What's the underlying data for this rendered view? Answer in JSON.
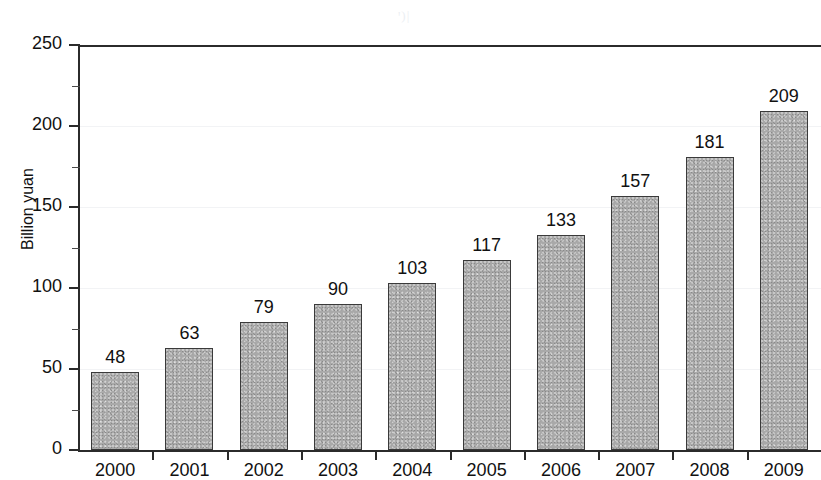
{
  "chart_data": {
    "type": "bar",
    "title": "",
    "subtitle": "",
    "xlabel": "",
    "ylabel": "Billion yuan",
    "categories": [
      "2000",
      "2001",
      "2002",
      "2003",
      "2004",
      "2005",
      "2006",
      "2007",
      "2008",
      "2009"
    ],
    "values": [
      48,
      63,
      79,
      90,
      103,
      117,
      133,
      157,
      181,
      209
    ],
    "value_labels": [
      "48",
      "63",
      "79",
      "90",
      "103",
      "117",
      "133",
      "157",
      "181",
      "209"
    ],
    "ylim": [
      0,
      250
    ],
    "ytick_values": [
      0,
      50,
      100,
      150,
      200,
      250
    ],
    "ytick_labels": [
      "0",
      "50",
      "100",
      "150",
      "200",
      "250"
    ],
    "yminor_values": [
      25,
      75,
      125,
      175,
      225
    ],
    "grid": "horizontal-faint",
    "legend": "none",
    "bar_color": "#a9a9a9",
    "bar_edge_color": "#3a3a3a",
    "axis_color": "#2b2b2b",
    "grid_color": "#f2f3f5",
    "background": "#ffffff",
    "annotations": [
      "data labels above each bar"
    ]
  },
  "artifact": {
    "scan_mark": "ꞌ)|"
  }
}
